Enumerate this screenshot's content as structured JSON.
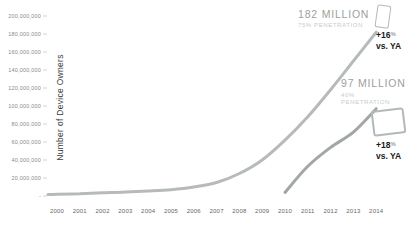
{
  "chart_data": {
    "type": "line",
    "title": "",
    "xlabel": "",
    "ylabel": "Number of Device Owners",
    "ylim_millions": [
      0,
      200
    ],
    "grid": false,
    "legend": "none",
    "y_ticks": [
      "200,000,000",
      "180,000,000",
      "160,000,000",
      "140,000,000",
      "120,000,000",
      "100,000,000",
      "80,000,000",
      "60,000,000",
      "40,000,000",
      "20,000,000",
      "-"
    ],
    "x_ticks": [
      "2000",
      "2001",
      "2002",
      "2003",
      "2004",
      "2005",
      "2006",
      "2007",
      "2008",
      "2009",
      "2010",
      "2011",
      "2012",
      "2013",
      "2014"
    ],
    "series": [
      {
        "name": "smartphone-owners",
        "color": "#b6babb",
        "x": [
          2000,
          2001,
          2002,
          2003,
          2004,
          2005,
          2006,
          2007,
          2008,
          2009,
          2010,
          2011,
          2012,
          2013,
          2014
        ],
        "values_millions": [
          2,
          2.5,
          3.5,
          4.5,
          5.5,
          7,
          10,
          15,
          25,
          40,
          62,
          88,
          118,
          150,
          182
        ]
      },
      {
        "name": "tablet-owners",
        "color": "#a2a6a7",
        "x": [
          2010,
          2011,
          2012,
          2013,
          2014
        ],
        "values_millions": [
          4,
          33,
          54,
          71,
          97
        ]
      }
    ],
    "annotations": {
      "smartphone": {
        "headline": "182 MILLION",
        "penetration": "75% PENETRATION",
        "delta": "+16",
        "delta_unit": "%",
        "vs": "vs. YA",
        "icon": "smartphone-icon"
      },
      "tablet": {
        "headline": "97 MILLION",
        "penetration_value": "40%",
        "penetration_word": "PENETRATION",
        "delta": "+18",
        "delta_unit": "%",
        "vs": "vs. YA",
        "icon": "tablet-icon"
      }
    },
    "colors": {
      "smartphone_line": "#b6babb",
      "tablet_line": "#a2a6a7",
      "headline_text": "#9b9fa0",
      "penetration_text": "#c7cbcc",
      "delta_text": "#1a1a1a",
      "axis_text": "#8a8a8a",
      "icon_outline": "#b3b8b9"
    }
  }
}
